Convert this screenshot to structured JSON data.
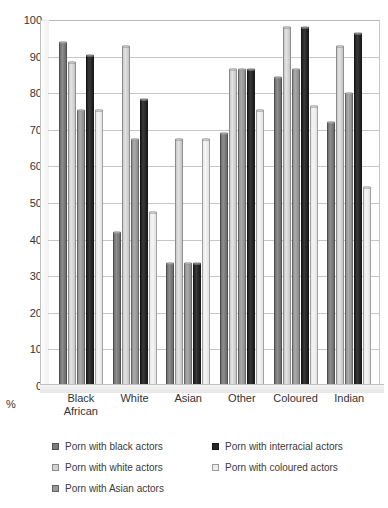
{
  "chart_data": {
    "type": "bar",
    "title": "",
    "xlabel": "",
    "ylabel": "%",
    "ylim": [
      0,
      100
    ],
    "ytick_step": 10,
    "yticks": [
      100,
      90,
      80,
      70,
      60,
      50,
      40,
      30,
      20,
      10,
      0
    ],
    "grid": true,
    "legend_position": "bottom",
    "categories": [
      "Black African",
      "White",
      "Asian",
      "Other",
      "Coloured",
      "Indian"
    ],
    "series": [
      {
        "name": "Porn with black actors",
        "color": "#7b7b7b",
        "values": [
          94.0,
          42.0,
          33.5,
          69.0,
          84.5,
          72.0
        ]
      },
      {
        "name": "Porn with white actors",
        "color": "#d4d4d4",
        "values": [
          88.5,
          93.0,
          67.5,
          86.5,
          98.0,
          93.0
        ]
      },
      {
        "name": "Porn with Asian actors",
        "color": "#989898",
        "values": [
          75.5,
          67.5,
          33.5,
          86.5,
          86.5,
          80.0
        ]
      },
      {
        "name": "Porn with interracial actors",
        "color": "#262626",
        "values": [
          90.5,
          78.5,
          33.5,
          86.5,
          98.0,
          96.5
        ]
      },
      {
        "name": "Porn with coloured actors",
        "color": "#ededed",
        "values": [
          75.5,
          47.5,
          67.5,
          75.5,
          76.5,
          54.5
        ]
      }
    ]
  },
  "axis": {
    "percent_symbol": "%"
  },
  "legend": {
    "items": [
      {
        "label": "Porn with black actors"
      },
      {
        "label": "Porn with interracial actors"
      },
      {
        "label": "Porn with white actors"
      },
      {
        "label": "Porn with coloured actors"
      },
      {
        "label": "Porn with Asian actors"
      }
    ]
  }
}
